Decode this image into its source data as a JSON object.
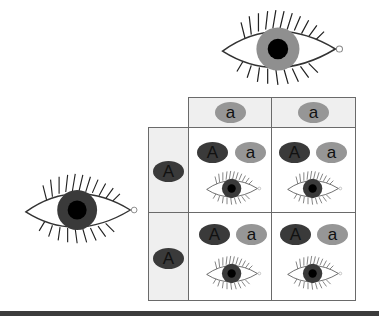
{
  "diagram": {
    "parents": {
      "top": {
        "genotype": [
          "a",
          "a"
        ],
        "eye_color": "light",
        "iris_color": "#8f8f8f"
      },
      "left": {
        "genotype": [
          "A",
          "A"
        ],
        "eye_color": "dark",
        "iris_color": "#3a3a3a"
      }
    },
    "column_headers": [
      "a",
      "a"
    ],
    "row_headers": [
      "A",
      "A"
    ],
    "cells": [
      [
        {
          "alleles": [
            "A",
            "a"
          ],
          "eye_color": "dark"
        },
        {
          "alleles": [
            "A",
            "a"
          ],
          "eye_color": "dark"
        }
      ],
      [
        {
          "alleles": [
            "A",
            "a"
          ],
          "eye_color": "dark"
        },
        {
          "alleles": [
            "A",
            "a"
          ],
          "eye_color": "dark"
        }
      ]
    ],
    "colors": {
      "dominant_allele": "#3a3a3a",
      "recessive_allele": "#969696",
      "header_bg": "#efefef",
      "border": "#6a6a6a",
      "bottom_bar": "#3c3c3c"
    }
  }
}
